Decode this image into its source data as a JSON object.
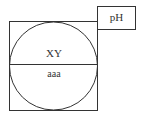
{
  "diagram": {
    "ph_box": {
      "label": "pH"
    },
    "circle": {
      "top_label": "XY",
      "bottom_label": "aaa"
    }
  }
}
